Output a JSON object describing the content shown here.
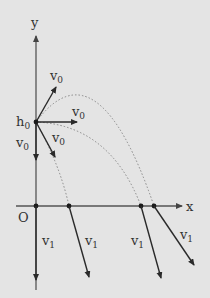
{
  "diagram": {
    "axes": {
      "x_label": "x",
      "y_label": "y",
      "origin_label": "O"
    },
    "launch_point": {
      "label": "h",
      "label_sub": "0"
    },
    "initial_velocities": [
      {
        "label": "v",
        "sub": "0",
        "direction": "up-right"
      },
      {
        "label": "v",
        "sub": "0",
        "direction": "horizontal"
      },
      {
        "label": "v",
        "sub": "0",
        "direction": "down-right"
      },
      {
        "label": "v",
        "sub": "0",
        "direction": "straight-down"
      }
    ],
    "final_velocities": [
      {
        "label": "v",
        "sub": "1",
        "landing": "origin"
      },
      {
        "label": "v",
        "sub": "1",
        "landing": "near"
      },
      {
        "label": "v",
        "sub": "1",
        "landing": "mid"
      },
      {
        "label": "v",
        "sub": "1",
        "landing": "far"
      }
    ]
  }
}
